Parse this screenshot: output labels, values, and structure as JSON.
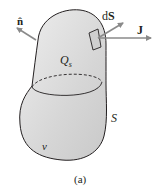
{
  "figure": {
    "caption": "(a)",
    "labels": {
      "normal_vector": "n̂",
      "surface_element": "dS",
      "current_density": "J",
      "enclosed_charge": "Q",
      "enclosed_charge_subscript": "s",
      "surface": "S",
      "volume": "v"
    },
    "colors": {
      "body_fill": "#d9d9d9",
      "outline": "#231f20",
      "arrow": "#8a8a8a",
      "patch_fill": "#c8c8c8"
    }
  }
}
